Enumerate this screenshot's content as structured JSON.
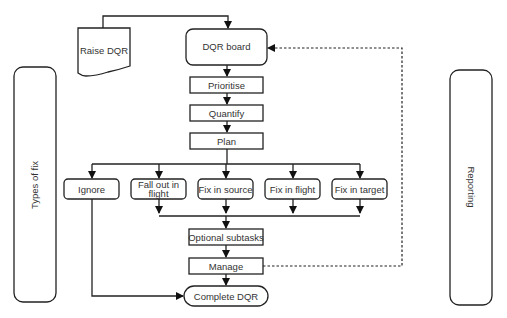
{
  "diagram": {
    "type": "flowchart",
    "nodes": {
      "raise_dqr": "Raise DQR",
      "dqr_board": "DQR board",
      "prioritise": "Prioritise",
      "quantify": "Quantify",
      "plan": "Plan",
      "ignore": "Ignore",
      "fall_out_line1": "Fall out in",
      "fall_out_line2": "flight",
      "fix_source": "Fix in source",
      "fix_flight": "Fix in flight",
      "fix_target": "Fix in target",
      "optional_subtasks": "Optional subtasks",
      "manage": "Manage",
      "complete_dqr": "Complete DQR"
    },
    "swimlanes": {
      "left": "Types of fix",
      "right": "Reporting"
    },
    "colors": {
      "stroke": "#222222",
      "text": "#333333",
      "background": "#ffffff"
    }
  }
}
